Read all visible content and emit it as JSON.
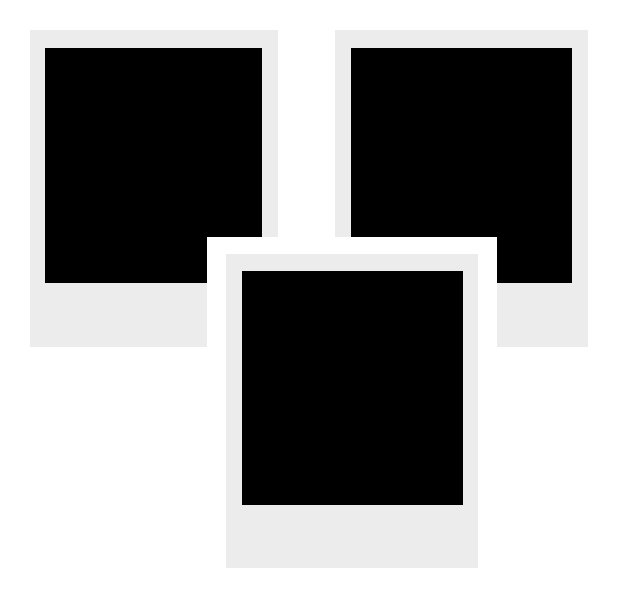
{
  "scene": {
    "background": "#ffffff",
    "frame_color": "#ececec",
    "photo_color": "#000000",
    "border_color": "#ffffff"
  },
  "frames": [
    {
      "id": "top-left",
      "frame": {
        "x": 30,
        "y": 30,
        "w": 248,
        "h": 317
      },
      "photo": {
        "x": 45,
        "y": 48,
        "w": 217,
        "h": 235
      }
    },
    {
      "id": "top-right",
      "frame": {
        "x": 335,
        "y": 30,
        "w": 253,
        "h": 317
      },
      "photo": {
        "x": 351,
        "y": 48,
        "w": 221,
        "h": 235
      }
    },
    {
      "id": "bottom",
      "border": {
        "x": 207,
        "y": 237,
        "w": 290,
        "h": 357
      },
      "frame": {
        "x": 226,
        "y": 254,
        "w": 252,
        "h": 314
      },
      "photo": {
        "x": 242,
        "y": 271,
        "w": 221,
        "h": 234
      }
    }
  ]
}
